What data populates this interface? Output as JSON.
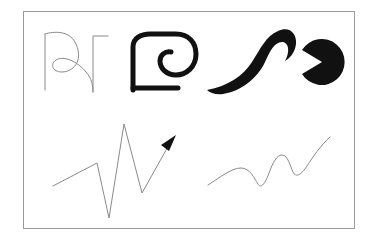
{
  "canvas": {
    "width": 373,
    "height": 241,
    "background_color": "#ffffff"
  },
  "frame": {
    "name": "figure-border",
    "x": 23,
    "y": 11,
    "width": 332,
    "height": 218,
    "stroke_color": "#9a9a9a",
    "stroke_width": 1,
    "fill_color": "#ffffff"
  },
  "palette": {
    "thin_gray": "#8a8a8a",
    "solid_black": "#111111",
    "frame_gray": "#9a9a9a",
    "background": "#ffffff"
  },
  "shapes": [
    {
      "id": "thin-rho-curl",
      "label": "thin rho curl outline",
      "row": "top",
      "column": 1,
      "style": "thin-outline",
      "stroke_color": "#8a8a8a",
      "stroke_width": 1,
      "fill": "none",
      "path": "M 45 34 L 45 90 M 45 34 C 45 34 68 26 76 44 C 84 62 72 72 62 72 C 52 72 50 64 56 60 C 64 55 78 62 86 72 C 92 79 93 86 93 92 M 93 92 L 93 36 L 108 36"
    },
    {
      "id": "thick-block-rho",
      "label": "thick blocky rho with inner spiral",
      "row": "top",
      "column": 2,
      "style": "thick-outline",
      "stroke_color": "#111111",
      "stroke_width": 5,
      "fill": "none",
      "path": "M 133 90 L 133 47 C 133 38 141 34 150 34 L 176 34 C 189 34 196 43 196 54 C 196 67 186 75 176 75 C 166 75 160 68 160 61 C 160 55 165 51 171 52"
    },
    {
      "id": "thick-block-rho-foot",
      "label": "thick rho baseline foot",
      "row": "top",
      "column": 2,
      "style": "thick-outline",
      "stroke_color": "#111111",
      "stroke_width": 5,
      "fill": "none",
      "path": "M 133 88 L 178 88"
    },
    {
      "id": "calligraphic-s-stroke",
      "label": "thick tapered calligraphic S brush stroke",
      "row": "top",
      "column": 3,
      "style": "filled",
      "fill_color": "#111111",
      "path": "M 207 90 C 228 86 243 76 252 62 C 261 48 266 36 278 31 C 289 26 297 33 296 44 C 295 53 289 59 285 61 C 290 52 289 43 283 42 C 275 41 270 51 265 62 C 257 79 241 91 223 94 C 216 95 210 93 207 90 Z"
    },
    {
      "id": "pacman-disc",
      "label": "filled pac-man disc with wedge cut",
      "row": "top",
      "column": 4,
      "style": "filled",
      "fill_color": "#111111",
      "center_x": 322,
      "center_y": 62,
      "radius": 23,
      "path": "M 322 62 L 302 50 A 23 23 0 1 1 302 74 Z"
    },
    {
      "id": "zigzag-arrow",
      "label": "thin zigzag polyline with arrowhead",
      "row": "bottom",
      "column": 1,
      "style": "thin-outline",
      "stroke_color": "#8a8a8a",
      "stroke_width": 1,
      "fill": "none",
      "points": "53,186 97,163 109,218 124,124 142,193 170,143",
      "arrowhead": {
        "fill_color": "#111111",
        "path": "M 176 135 L 161 145 L 169 151 Z"
      }
    },
    {
      "id": "rising-wave",
      "label": "thin rising sine wave",
      "row": "bottom",
      "column": 2,
      "style": "thin-outline",
      "stroke_color": "#8a8a8a",
      "stroke_width": 1,
      "fill": "none",
      "path": "M 208 185 C 222 176 232 168 241 168 C 250 168 254 178 258 184 C 261 189 265 184 269 173 C 273 162 277 155 282 155 C 288 155 290 166 293 172 C 296 178 301 175 307 166 C 313 157 320 146 330 137"
    }
  ]
}
